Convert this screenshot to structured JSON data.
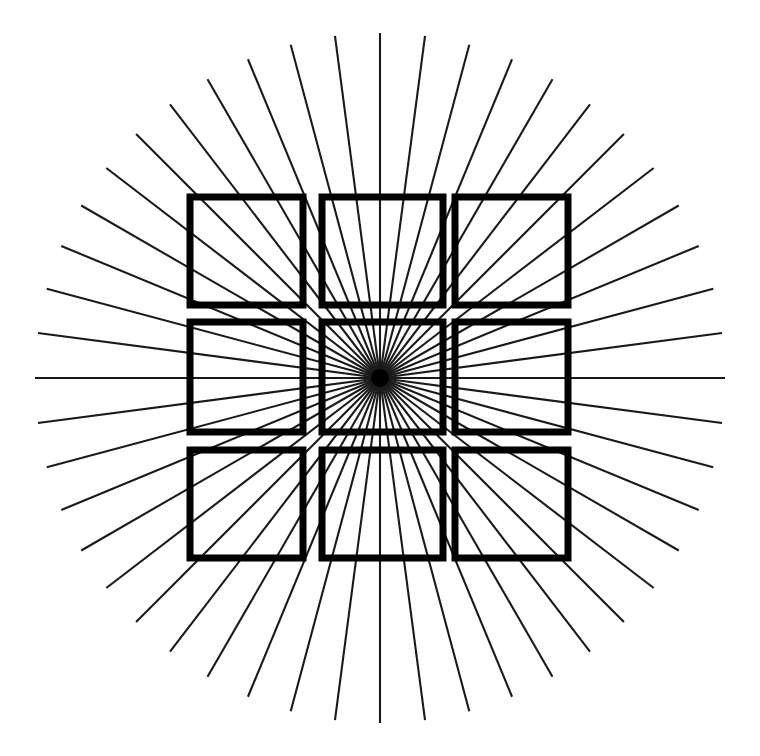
{
  "figure": {
    "caption": "",
    "background_color": "#ffffff",
    "line_color": "#1a1a1a",
    "square_color": "#000000",
    "width": 760,
    "height": 756
  },
  "chart_data": {
    "type": "scatter",
    "subtitle": "",
    "xlabel": "",
    "ylabel": "",
    "xlim": [
      0,
      760
    ],
    "ylim": [
      0,
      756
    ],
    "grid": false,
    "legend_position": "none",
    "annotations": [],
    "tick_labels": {
      "x": [],
      "y": []
    },
    "legend_entries": [],
    "radial_burst": {
      "center_x": 380,
      "center_y": 378,
      "ray_count": 48,
      "angle_step_degrees": 7.5,
      "start_angle_degrees": 0,
      "inner_radius": 0,
      "outer_radius": 345,
      "stroke_width": 2.1,
      "color": "#1a1a1a",
      "hub_radius": 9,
      "hub_color": "#000000"
    },
    "square_grid": {
      "rows": 3,
      "columns": 3,
      "stroke_width": 7,
      "color": "#000000",
      "fill": "none",
      "column_left_edges": [
        190,
        322,
        455
      ],
      "column_right_edges": [
        303,
        443,
        568
      ],
      "row_top_edges": [
        197,
        322,
        450
      ],
      "row_bottom_edges": [
        305,
        432,
        558
      ],
      "squares": [
        {
          "name": "top-left",
          "x": 190,
          "y": 197,
          "width": 113,
          "height": 108
        },
        {
          "name": "top-center",
          "x": 322,
          "y": 197,
          "width": 121,
          "height": 108
        },
        {
          "name": "top-right",
          "x": 455,
          "y": 197,
          "width": 113,
          "height": 108
        },
        {
          "name": "middle-left",
          "x": 190,
          "y": 322,
          "width": 113,
          "height": 110
        },
        {
          "name": "middle-center",
          "x": 322,
          "y": 322,
          "width": 121,
          "height": 110
        },
        {
          "name": "middle-right",
          "x": 455,
          "y": 322,
          "width": 113,
          "height": 110
        },
        {
          "name": "bottom-left",
          "x": 190,
          "y": 450,
          "width": 113,
          "height": 108
        },
        {
          "name": "bottom-center",
          "x": 322,
          "y": 450,
          "width": 121,
          "height": 108
        },
        {
          "name": "bottom-right",
          "x": 455,
          "y": 450,
          "width": 113,
          "height": 108
        }
      ]
    }
  }
}
